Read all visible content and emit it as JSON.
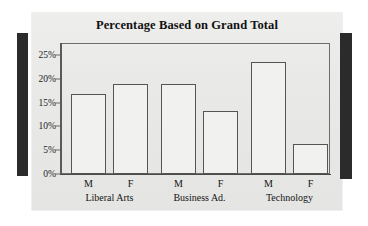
{
  "chart_data": {
    "type": "bar",
    "title": "Percentage Based on Grand Total",
    "xlabel": "",
    "ylabel": "",
    "ylim": [
      0,
      25
    ],
    "grid": false,
    "legend": "none",
    "categories": [
      "Liberal Arts",
      "Business Ad.",
      "Technology"
    ],
    "subcategories": [
      "M",
      "F"
    ],
    "ytick_labels": [
      "0%",
      "5%",
      "10%",
      "15%",
      "20%",
      "25%"
    ],
    "ytick_values": [
      0,
      5,
      10,
      15,
      20,
      25
    ],
    "series": [
      {
        "name": "M",
        "values": [
          16.8,
          19.0,
          23.5
        ]
      },
      {
        "name": "F",
        "values": [
          18.9,
          13.2,
          6.2
        ]
      }
    ],
    "bars": [
      {
        "group": "Liberal Arts",
        "series": "M",
        "value": 16.8
      },
      {
        "group": "Liberal Arts",
        "series": "F",
        "value": 18.9
      },
      {
        "group": "Business Ad.",
        "series": "M",
        "value": 19.0
      },
      {
        "group": "Business Ad.",
        "series": "F",
        "value": 13.2
      },
      {
        "group": "Technology",
        "series": "M",
        "value": 23.5
      },
      {
        "group": "Technology",
        "series": "F",
        "value": 6.2
      }
    ],
    "colors": {
      "bar_fill": "#f1f1ef",
      "bar_border": "#555555",
      "panel_background": "#e9e9e7",
      "axis": "#5a5a5a",
      "text": "#141414",
      "edge_bar": "#2b2b2b"
    }
  }
}
